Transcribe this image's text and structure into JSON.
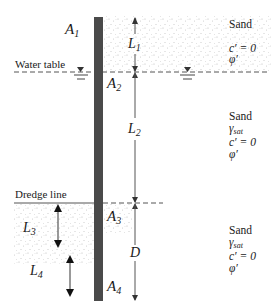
{
  "figure": {
    "type": "cantilever sheet pile diagram",
    "wall": {
      "label": "sheet pile"
    },
    "areas": [
      {
        "id": "A1",
        "base": "A",
        "sub": "1"
      },
      {
        "id": "A2",
        "base": "A",
        "sub": "2"
      },
      {
        "id": "A3",
        "base": "A",
        "sub": "3"
      },
      {
        "id": "A4",
        "base": "A",
        "sub": "4"
      }
    ],
    "dimensions": [
      {
        "id": "L1",
        "base": "L",
        "sub": "1"
      },
      {
        "id": "L2",
        "base": "L",
        "sub": "2"
      },
      {
        "id": "D",
        "base": "D",
        "sub": ""
      },
      {
        "id": "L3",
        "base": "L",
        "sub": "3"
      },
      {
        "id": "L4",
        "base": "L",
        "sub": "4"
      }
    ],
    "lines": {
      "water_table": "Water table",
      "dredge_line": "Dredge line"
    },
    "layers": [
      {
        "name": "Sand",
        "gamma": "",
        "c": "c′ = 0",
        "phi": "φ′"
      },
      {
        "name": "Sand",
        "gamma": "γ",
        "gamma_sub": "sat",
        "c": "c′ = 0",
        "phi": "φ′"
      },
      {
        "name": "Sand",
        "gamma": "γ",
        "gamma_sub": "sat",
        "c": "c′ = 0",
        "phi": "φ′"
      }
    ],
    "colors": {
      "wall": "#4a4a4a",
      "line": "#555555",
      "stipple": "#b8b8b8",
      "text": "#1a1a1a"
    }
  }
}
